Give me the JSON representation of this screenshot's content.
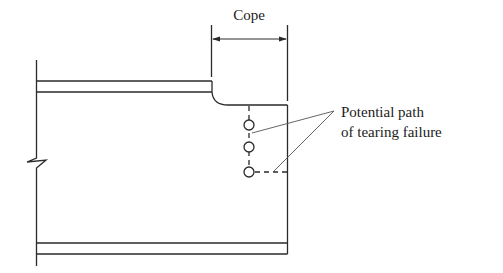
{
  "diagram": {
    "type": "coped-beam-block-shear",
    "labels": {
      "cope": "Cope",
      "tearing_line1": "Potential path",
      "tearing_line2": "of tearing failure"
    },
    "elements": {
      "holes": [
        {
          "cx": 249,
          "cy": 125,
          "r": 5
        },
        {
          "cx": 249,
          "cy": 147,
          "r": 5
        },
        {
          "cx": 249,
          "cy": 172,
          "r": 5
        }
      ],
      "break_symbol": "zigzag-break-in-support",
      "dimension": "cope-length-arrow"
    },
    "colors": {
      "stroke": "#2a2a2a",
      "leader": "#555555",
      "background": "#ffffff"
    }
  }
}
